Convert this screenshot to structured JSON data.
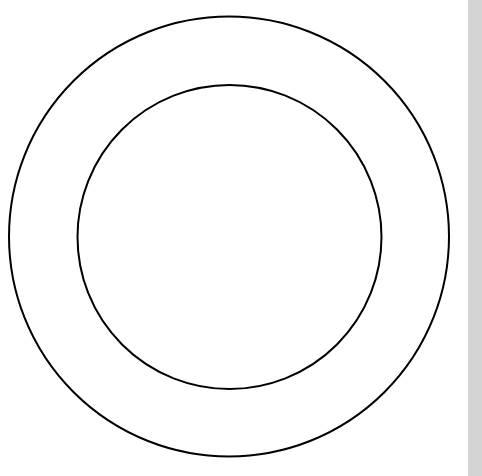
{
  "app": {
    "title": "Concentric Circles Drawing",
    "background_color": "#ffffff",
    "width": 482,
    "height": 476
  },
  "canvas": {
    "name": "drawing-canvas",
    "background_color": "#ffffff",
    "width": 468,
    "height": 476
  },
  "figure": {
    "type": "concentric-circles",
    "stroke_color": "#000000",
    "fill_color": "none",
    "stroke_width": 2,
    "shapes": [
      {
        "name": "outer-circle",
        "cx": 229,
        "cy": 236.5,
        "r": 220,
        "stroke": "#000000",
        "stroke_width": 2,
        "fill": "none"
      },
      {
        "name": "inner-circle",
        "cx": 229.5,
        "cy": 237,
        "r": 152,
        "stroke": "#000000",
        "stroke_width": 2,
        "fill": "none"
      }
    ]
  },
  "scrollbar": {
    "name": "vertical-scrollbar",
    "track_color": "#d4d4d4",
    "thumb_color": "#d4d4d4",
    "x": 468,
    "width": 14,
    "thumb_top": 0,
    "thumb_height": 476
  },
  "artifacts": {
    "faint_text": "",
    "color": "#fafafa"
  }
}
